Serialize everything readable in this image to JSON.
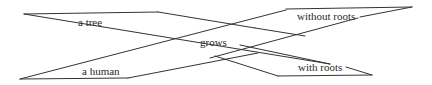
{
  "diagram": {
    "type": "word-structure diagram",
    "nodes": {
      "top_left": "a tree",
      "bottom_left": "a human",
      "center": "grows",
      "top_right": "without roots",
      "bottom_right": "with roots"
    },
    "colors": {
      "line": "#333333",
      "text": "#2a2a2a",
      "background": "#ffffff"
    }
  }
}
